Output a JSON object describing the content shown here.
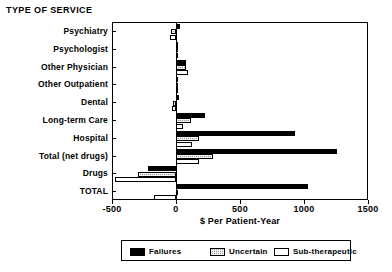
{
  "chart_data": {
    "type": "bar",
    "orientation": "horizontal",
    "title": "TYPE OF SERVICE",
    "xlabel": "$ Per Patient-Year",
    "ylabel": "",
    "xlim": [
      -500,
      1500
    ],
    "xticks": [
      -500,
      0,
      500,
      1000,
      1500
    ],
    "xticklabels": [
      "-500",
      "0",
      "500",
      "1000",
      "1500"
    ],
    "grid": false,
    "legend_position": "bottom",
    "categories": [
      "Psychiatry",
      "Psychologist",
      "Other Physician",
      "Other Outpatient",
      "Dental",
      "Long-term Care",
      "Hospital",
      "Total (net drugs)",
      "Drugs",
      "TOTAL"
    ],
    "series": [
      {
        "name": "Failures",
        "fill": "solid-black",
        "values": [
          30,
          5,
          80,
          8,
          25,
          230,
          930,
          1255,
          -215,
          1030
        ]
      },
      {
        "name": "Uncertain",
        "fill": "hatched-gray",
        "values": [
          -40,
          3,
          75,
          5,
          -20,
          115,
          180,
          290,
          -295,
          5
        ]
      },
      {
        "name": "Sub-therapeutic",
        "fill": "white",
        "values": [
          -45,
          2,
          95,
          4,
          -30,
          55,
          125,
          180,
          -480,
          -170
        ]
      }
    ],
    "legend": [
      {
        "label": "Failures",
        "swatch": "failures"
      },
      {
        "label": "Uncertain",
        "swatch": "uncertain"
      },
      {
        "label": "Sub-therapeutic",
        "swatch": "sub"
      }
    ]
  }
}
